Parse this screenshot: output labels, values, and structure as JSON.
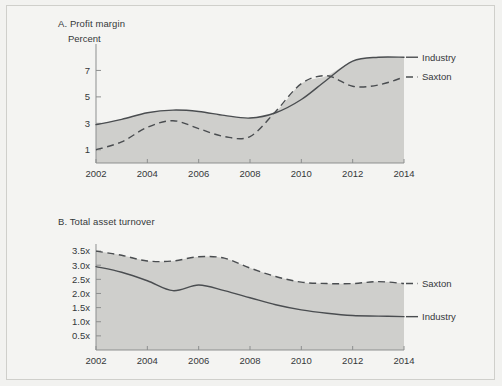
{
  "figure": {
    "background_color": "#f4f4f2",
    "fill_color": "#cfcfcc",
    "line_color": "#4a4d50",
    "axis_color": "#8d8f8f"
  },
  "panelA": {
    "title": "A. Profit margin",
    "unit_label": "Percent"
  },
  "panelB": {
    "title": "B. Total asset turnover"
  },
  "chart_data": [
    {
      "type": "line",
      "title": "A. Profit margin",
      "xlabel": "",
      "ylabel": "Percent",
      "ylim": [
        0,
        9
      ],
      "xlim": [
        2002,
        2014
      ],
      "grid": false,
      "legend_position": "right",
      "yticks": [
        "1",
        "3",
        "5",
        "7"
      ],
      "ytick_values": [
        1,
        3,
        5,
        7
      ],
      "xticks": [
        "2002",
        "2004",
        "2006",
        "2008",
        "2010",
        "2012",
        "2014"
      ],
      "x": [
        2002,
        2003,
        2004,
        2005,
        2006,
        2007,
        2008,
        2009,
        2010,
        2011,
        2012,
        2013,
        2014
      ],
      "series": [
        {
          "name": "Industry",
          "style": "solid",
          "values": [
            2.9,
            3.3,
            3.8,
            4.0,
            3.9,
            3.6,
            3.4,
            3.8,
            4.8,
            6.3,
            7.7,
            8.0,
            8.0
          ]
        },
        {
          "name": "Saxton",
          "style": "dashed",
          "values": [
            1.0,
            1.6,
            2.7,
            3.2,
            2.6,
            2.0,
            2.0,
            3.9,
            6.0,
            6.6,
            5.8,
            5.9,
            6.5
          ]
        }
      ]
    },
    {
      "type": "line",
      "title": "B. Total asset turnover",
      "xlabel": "",
      "ylabel": "",
      "ylim": [
        0,
        3.75
      ],
      "xlim": [
        2002,
        2014
      ],
      "grid": false,
      "legend_position": "right",
      "yticks": [
        "0.5x",
        "1.0x",
        "1.5x",
        "2.0x",
        "2.5x",
        "3.0x",
        "3.5x"
      ],
      "ytick_values": [
        0.5,
        1.0,
        1.5,
        2.0,
        2.5,
        3.0,
        3.5
      ],
      "xticks": [
        "2002",
        "2004",
        "2006",
        "2008",
        "2010",
        "2012",
        "2014"
      ],
      "x": [
        2002,
        2003,
        2004,
        2005,
        2006,
        2007,
        2008,
        2009,
        2010,
        2011,
        2012,
        2013,
        2014
      ],
      "series": [
        {
          "name": "Saxton",
          "style": "dashed",
          "values": [
            3.5,
            3.35,
            3.15,
            3.15,
            3.3,
            3.25,
            2.9,
            2.6,
            2.4,
            2.35,
            2.35,
            2.42,
            2.35
          ]
        },
        {
          "name": "Industry",
          "style": "solid",
          "values": [
            2.95,
            2.75,
            2.45,
            2.1,
            2.3,
            2.1,
            1.85,
            1.6,
            1.42,
            1.3,
            1.22,
            1.2,
            1.18
          ]
        }
      ]
    }
  ]
}
